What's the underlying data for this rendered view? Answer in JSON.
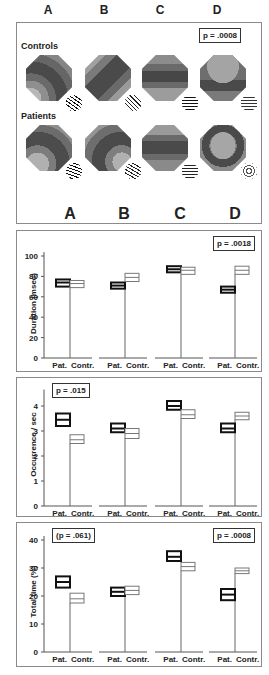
{
  "columns": [
    "A",
    "B",
    "C",
    "D"
  ],
  "maps_panel": {
    "p_value": "p = .0008",
    "rows": [
      {
        "label": "Controls"
      },
      {
        "label": "Patients"
      }
    ]
  },
  "colors": {
    "map_dark": "#4a4a4a",
    "map_mid": "#6f6f6f",
    "map_light": "#a8a8a8",
    "patient_box": "#111111",
    "control_box": "#777777",
    "panel_border": "#8a8a8a"
  },
  "chart_data": [
    {
      "type": "box",
      "title": "",
      "ylabel": "Duration (msec)",
      "xlabel": "",
      "ylim": [
        0,
        100
      ],
      "yticks": [
        0,
        20,
        40,
        60,
        80,
        100
      ],
      "categories": [
        "A",
        "B",
        "C",
        "D"
      ],
      "group_labels": [
        "Pat.",
        "Contr."
      ],
      "annotations": [
        {
          "text": "p = .0018",
          "position": "top-right"
        }
      ],
      "series": [
        {
          "name": "Pat.",
          "mean": [
            74,
            71,
            87,
            67
          ],
          "low": [
            70,
            68,
            84,
            64
          ],
          "high": [
            77,
            74,
            90,
            70
          ]
        },
        {
          "name": "Contr.",
          "mean": [
            73,
            79,
            86,
            86
          ],
          "low": [
            69,
            75,
            82,
            82
          ],
          "high": [
            76,
            83,
            89,
            90
          ]
        }
      ]
    },
    {
      "type": "box",
      "title": "",
      "ylabel": "Occurrence / sec",
      "xlabel": "",
      "ylim": [
        0,
        4.5
      ],
      "yticks": [
        0,
        1,
        2,
        3,
        4
      ],
      "categories": [
        "A",
        "B",
        "C",
        "D"
      ],
      "group_labels": [
        "Pat.",
        "Contr."
      ],
      "annotations": [
        {
          "text": "p = .015",
          "position": "top-left"
        }
      ],
      "series": [
        {
          "name": "Pat.",
          "mean": [
            3.45,
            3.1,
            4.0,
            3.1
          ],
          "low": [
            3.2,
            2.95,
            3.85,
            2.95
          ],
          "high": [
            3.7,
            3.3,
            4.2,
            3.3
          ]
        },
        {
          "name": "Contr.",
          "mean": [
            2.65,
            2.9,
            3.65,
            3.6
          ],
          "low": [
            2.5,
            2.7,
            3.5,
            3.45
          ],
          "high": [
            2.85,
            3.1,
            3.85,
            3.75
          ]
        }
      ]
    },
    {
      "type": "box",
      "title": "",
      "ylabel": "Total time (%)",
      "xlabel": "",
      "ylim": [
        0,
        40
      ],
      "yticks": [
        0,
        10,
        20,
        30,
        40
      ],
      "categories": [
        "A",
        "B",
        "C",
        "D"
      ],
      "group_labels": [
        "Pat.",
        "Contr."
      ],
      "annotations": [
        {
          "text": "(p = .061)",
          "position": "top-left"
        },
        {
          "text": "p = .0008",
          "position": "top-right"
        }
      ],
      "series": [
        {
          "name": "Pat.",
          "mean": [
            25,
            21.5,
            34,
            20.5
          ],
          "low": [
            23,
            20,
            32.5,
            18.5
          ],
          "high": [
            27,
            23,
            36,
            22.5
          ]
        },
        {
          "name": "Contr.",
          "mean": [
            19,
            22,
            30.5,
            29
          ],
          "low": [
            17.5,
            20.5,
            29,
            28
          ],
          "high": [
            21,
            23.5,
            32,
            30
          ]
        }
      ]
    }
  ]
}
